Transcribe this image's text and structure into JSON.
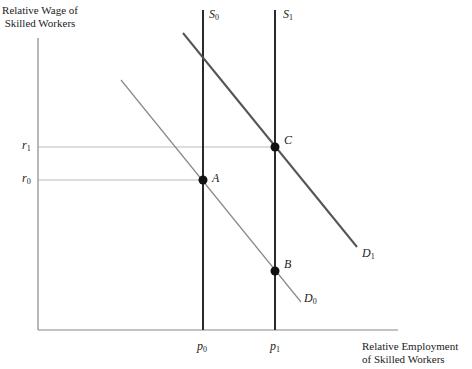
{
  "diagram": {
    "y_axis_title": [
      "Relative Wage of",
      "Skilled Workers"
    ],
    "x_axis_title": [
      "Relative Employment",
      "of Skilled Workers"
    ],
    "curves": {
      "S0": {
        "letter": "S",
        "sub": "0"
      },
      "S1": {
        "letter": "S",
        "sub": "1"
      },
      "D0": {
        "letter": "D",
        "sub": "0"
      },
      "D1": {
        "letter": "D",
        "sub": "1"
      }
    },
    "y_ticks": {
      "r1": {
        "letter": "r",
        "sub": "1"
      },
      "r0": {
        "letter": "r",
        "sub": "0"
      }
    },
    "x_ticks": {
      "p0": {
        "letter": "p",
        "sub": "0"
      },
      "p1": {
        "letter": "p",
        "sub": "1"
      }
    },
    "points": {
      "A": "A",
      "B": "B",
      "C": "C"
    },
    "colors": {
      "axis": "#888888",
      "supply": "#2a2a2a",
      "d0": "#8a8a8a",
      "d1": "#555555",
      "guide": "#aaaaaa",
      "point": "#111111"
    }
  }
}
